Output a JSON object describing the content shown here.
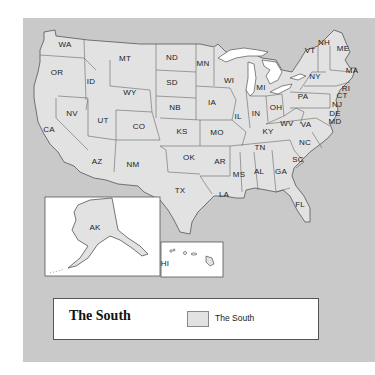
{
  "map": {
    "title": "United States",
    "colors": {
      "background": "#ffffff",
      "water": "#c9c9c9",
      "land": "#e2e2e2",
      "border": "#555555",
      "lakes": "#ffffff"
    },
    "states": [
      {
        "abbr": "WA",
        "x": 65,
        "y": 44
      },
      {
        "abbr": "OR",
        "x": 57,
        "y": 72
      },
      {
        "abbr": "ID",
        "x": 91,
        "y": 81
      },
      {
        "abbr": "MT",
        "x": 125,
        "y": 58
      },
      {
        "abbr": "WY",
        "x": 130,
        "y": 92
      },
      {
        "abbr": "NV",
        "x": 72,
        "y": 113
      },
      {
        "abbr": "UT",
        "x": 103,
        "y": 120
      },
      {
        "abbr": "CO",
        "x": 139,
        "y": 126
      },
      {
        "abbr": "CA",
        "x": 49,
        "y": 129
      },
      {
        "abbr": "AZ",
        "x": 97,
        "y": 161
      },
      {
        "abbr": "NM",
        "x": 133,
        "y": 164
      },
      {
        "abbr": "ND",
        "x": 172,
        "y": 57
      },
      {
        "abbr": "SD",
        "x": 172,
        "y": 82
      },
      {
        "abbr": "NB",
        "x": 175,
        "y": 107
      },
      {
        "abbr": "KS",
        "x": 182,
        "y": 131
      },
      {
        "abbr": "OK",
        "x": 189,
        "y": 157
      },
      {
        "abbr": "TX",
        "x": 180,
        "y": 190
      },
      {
        "abbr": "MN",
        "x": 203,
        "y": 63
      },
      {
        "abbr": "WI",
        "x": 229,
        "y": 80
      },
      {
        "abbr": "IA",
        "x": 212,
        "y": 102
      },
      {
        "abbr": "IL",
        "x": 238,
        "y": 116
      },
      {
        "abbr": "MO",
        "x": 217,
        "y": 132
      },
      {
        "abbr": "AR",
        "x": 220,
        "y": 161
      },
      {
        "abbr": "LA",
        "x": 224,
        "y": 194
      },
      {
        "abbr": "MI",
        "x": 261,
        "y": 87
      },
      {
        "abbr": "IN",
        "x": 256,
        "y": 113
      },
      {
        "abbr": "OH",
        "x": 276,
        "y": 107
      },
      {
        "abbr": "KY",
        "x": 268,
        "y": 131
      },
      {
        "abbr": "TN",
        "x": 260,
        "y": 147
      },
      {
        "abbr": "MS",
        "x": 239,
        "y": 174
      },
      {
        "abbr": "AL",
        "x": 259,
        "y": 171
      },
      {
        "abbr": "GA",
        "x": 281,
        "y": 171
      },
      {
        "abbr": "WV",
        "x": 287,
        "y": 123
      },
      {
        "abbr": "VA",
        "x": 306,
        "y": 124
      },
      {
        "abbr": "NC",
        "x": 305,
        "y": 142
      },
      {
        "abbr": "SC",
        "x": 298,
        "y": 159
      },
      {
        "abbr": "PA",
        "x": 303,
        "y": 96
      },
      {
        "abbr": "NY",
        "x": 315,
        "y": 76
      },
      {
        "abbr": "VT",
        "x": 310,
        "y": 50
      },
      {
        "abbr": "NH",
        "x": 324,
        "y": 42
      },
      {
        "abbr": "ME",
        "x": 343,
        "y": 48
      },
      {
        "abbr": "MA",
        "x": 352,
        "y": 70
      },
      {
        "abbr": "RI",
        "x": 346,
        "y": 88
      },
      {
        "abbr": "CT",
        "x": 342,
        "y": 95
      },
      {
        "abbr": "NJ",
        "x": 337,
        "y": 104
      },
      {
        "abbr": "DE",
        "x": 335,
        "y": 113
      },
      {
        "abbr": "MD",
        "x": 335,
        "y": 121
      },
      {
        "abbr": "FL",
        "x": 300,
        "y": 204
      },
      {
        "abbr": "AK",
        "x": 95,
        "y": 227
      },
      {
        "abbr": "HI",
        "x": 165,
        "y": 263
      }
    ]
  },
  "legend": {
    "title": "The South",
    "items": [
      {
        "label": "The South",
        "color": "#e2e2e2"
      }
    ]
  }
}
